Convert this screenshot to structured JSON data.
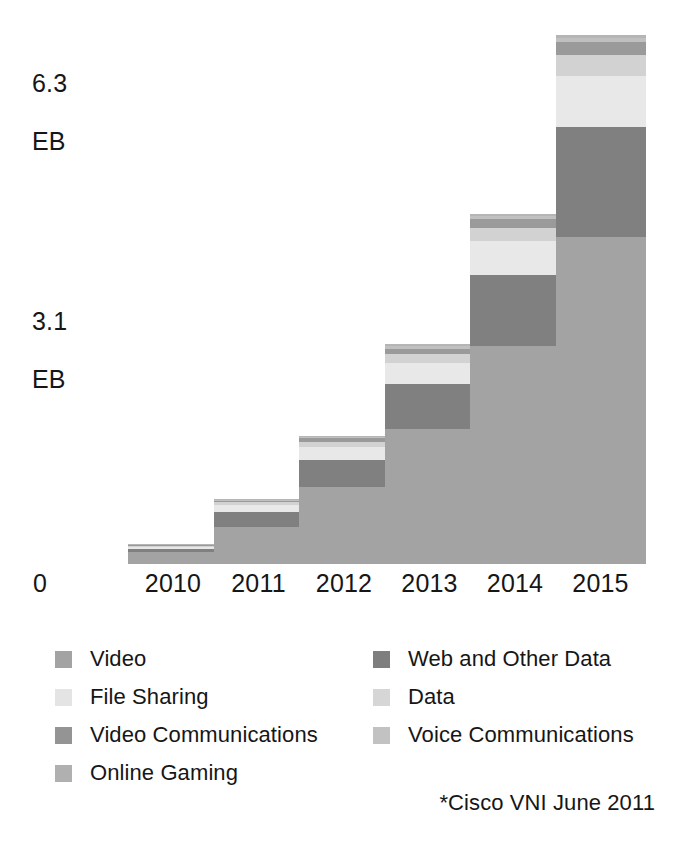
{
  "chart_data": {
    "type": "bar",
    "stacked": true,
    "title": "",
    "subtitle": "",
    "xlabel": "",
    "ylabel": "EB",
    "grid": false,
    "legend_position": "bottom",
    "categories": [
      "2010",
      "2011",
      "2012",
      "2013",
      "2014",
      "2015"
    ],
    "y_axis": {
      "origin_label": "0",
      "ticks": [
        {
          "value": 0,
          "label": "0"
        },
        {
          "value": 3.1,
          "label": "3.1\nEB",
          "number": "3.1",
          "unit": "EB"
        },
        {
          "value": 6.3,
          "label": "6.3\nEB",
          "number": "6.3",
          "unit": "EB"
        }
      ],
      "ylim": [
        0,
        6.3
      ],
      "unit": "EB"
    },
    "series": [
      {
        "name": "Video",
        "color": "#a3a3a3",
        "values": [
          0.14,
          0.45,
          0.93,
          1.62,
          2.62,
          3.93
        ]
      },
      {
        "name": "Web and Other Data",
        "color": "#808080",
        "values": [
          0.04,
          0.17,
          0.32,
          0.54,
          0.86,
          1.33
        ]
      },
      {
        "name": "File Sharing",
        "color": "#e8e8e8",
        "values": [
          0.03,
          0.09,
          0.16,
          0.26,
          0.4,
          0.61
        ]
      },
      {
        "name": "Data",
        "color": "#d2d2d2",
        "values": [
          0.01,
          0.03,
          0.06,
          0.1,
          0.16,
          0.25
        ]
      },
      {
        "name": "Video Communications",
        "color": "#9a9a9a",
        "values": [
          0.01,
          0.02,
          0.04,
          0.07,
          0.11,
          0.16
        ]
      },
      {
        "name": "Voice Communications",
        "color": "#c0c0c0",
        "values": [
          0.005,
          0.01,
          0.02,
          0.03,
          0.04,
          0.05
        ]
      },
      {
        "name": "Online Gaming",
        "color": "#b5b5b5",
        "values": [
          0.005,
          0.01,
          0.01,
          0.02,
          0.02,
          0.03
        ]
      }
    ],
    "totals": [
      0.24,
      0.78,
      1.54,
      2.64,
      4.21,
      6.36
    ],
    "annotations": [
      "*Cisco VNI June 2011"
    ]
  },
  "axis": {
    "y_top": {
      "number": "6.3",
      "unit": "EB"
    },
    "y_mid": {
      "number": "3.1",
      "unit": "EB"
    },
    "x_origin": "0",
    "x_ticks": [
      "2010",
      "2011",
      "2012",
      "2013",
      "2014",
      "2015"
    ]
  },
  "legend": {
    "left_column": [
      {
        "label": "Video",
        "color": "#a3a3a3"
      },
      {
        "label": "File Sharing",
        "color": "#e4e4e4"
      },
      {
        "label": "Video Communications",
        "color": "#949494"
      },
      {
        "label": "Online Gaming",
        "color": "#b0b0b0"
      }
    ],
    "right_column": [
      {
        "label": "Web and Other Data",
        "color": "#7e7e7e"
      },
      {
        "label": "Data",
        "color": "#d6d6d6"
      },
      {
        "label": "Voice Communications",
        "color": "#c2c2c2"
      }
    ]
  },
  "footnote": "*Cisco VNI June 2011"
}
